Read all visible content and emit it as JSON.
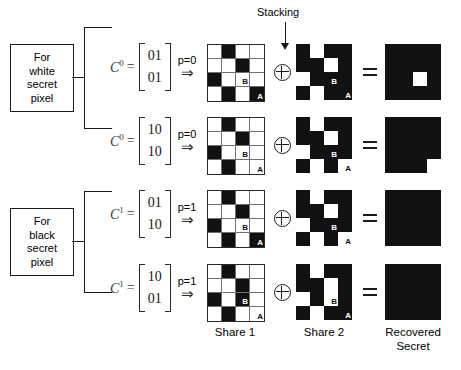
{
  "figure": {
    "stacking_label": "Stacking",
    "captions": {
      "share1": "Share 1",
      "share2": "Share 2",
      "recovered_line1": "Recovered",
      "recovered_line2": "Secret"
    },
    "groups": [
      {
        "id": "white",
        "line1": "For",
        "line2": "white",
        "line3": "secret",
        "line4": "pixel"
      },
      {
        "id": "black",
        "line1": "For",
        "line2": "black",
        "line3": "secret",
        "line4": "pixel"
      }
    ],
    "operators": {
      "xor": "⊕",
      "equals": "=",
      "implies": "⇒",
      "assign": "="
    },
    "marks": {
      "a": "A",
      "b": "B"
    },
    "rows": [
      {
        "matrix_name": "C",
        "matrix_sup": "0",
        "matrix_row1": "01",
        "matrix_row2": "01",
        "p_label": "p=0",
        "share1": [
          [
            "w",
            "b",
            "w",
            "w"
          ],
          [
            "w",
            "w",
            "b",
            "w"
          ],
          [
            "b",
            "w",
            "w",
            "w"
          ],
          [
            "w",
            "b",
            "w",
            "b"
          ]
        ],
        "share1_outlined": true,
        "share1_mark_b": {
          "row": 2,
          "col": 2,
          "on": "w"
        },
        "share1_mark_a": {
          "row": 3,
          "col": 3,
          "on": "b"
        },
        "share2": [
          [
            "b",
            "w",
            "b",
            "b"
          ],
          [
            "b",
            "b",
            "w",
            "b"
          ],
          [
            "w",
            "b",
            "b",
            "b"
          ],
          [
            "b",
            "w",
            "b",
            "b"
          ]
        ],
        "share2_outlined": false,
        "share2_mark_b": {
          "row": 2,
          "col": 2,
          "on": "b"
        },
        "share2_mark_a": {
          "row": 3,
          "col": 3,
          "on": "b"
        },
        "secret": [
          [
            "b",
            "b",
            "b",
            "b"
          ],
          [
            "b",
            "b",
            "b",
            "b"
          ],
          [
            "b",
            "b",
            "w",
            "b"
          ],
          [
            "b",
            "b",
            "b",
            "b"
          ]
        ]
      },
      {
        "matrix_name": "C",
        "matrix_sup": "0",
        "matrix_row1": "10",
        "matrix_row2": "10",
        "p_label": "p=0",
        "share1": [
          [
            "w",
            "b",
            "w",
            "w"
          ],
          [
            "w",
            "w",
            "b",
            "w"
          ],
          [
            "b",
            "w",
            "w",
            "w"
          ],
          [
            "w",
            "b",
            "w",
            "w"
          ]
        ],
        "share1_outlined": true,
        "share1_mark_b": {
          "row": 2,
          "col": 2,
          "on": "w"
        },
        "share1_mark_a": {
          "row": 3,
          "col": 3,
          "on": "w"
        },
        "share2": [
          [
            "b",
            "w",
            "b",
            "b"
          ],
          [
            "b",
            "b",
            "w",
            "b"
          ],
          [
            "w",
            "b",
            "b",
            "b"
          ],
          [
            "b",
            "w",
            "b",
            "w"
          ]
        ],
        "share2_outlined": false,
        "share2_mark_b": {
          "row": 2,
          "col": 2,
          "on": "b"
        },
        "share2_mark_a": {
          "row": 3,
          "col": 3,
          "on": "w"
        },
        "secret": [
          [
            "b",
            "b",
            "b",
            "b"
          ],
          [
            "b",
            "b",
            "b",
            "b"
          ],
          [
            "b",
            "b",
            "b",
            "b"
          ],
          [
            "b",
            "b",
            "b",
            "w"
          ]
        ]
      },
      {
        "matrix_name": "C",
        "matrix_sup": "1",
        "matrix_row1": "01",
        "matrix_row2": "10",
        "p_label": "p=1",
        "share1": [
          [
            "w",
            "b",
            "w",
            "w"
          ],
          [
            "w",
            "w",
            "b",
            "w"
          ],
          [
            "b",
            "w",
            "w",
            "w"
          ],
          [
            "w",
            "b",
            "w",
            "b"
          ]
        ],
        "share1_outlined": true,
        "share1_mark_b": {
          "row": 2,
          "col": 2,
          "on": "w"
        },
        "share1_mark_a": {
          "row": 3,
          "col": 3,
          "on": "b"
        },
        "share2": [
          [
            "b",
            "w",
            "b",
            "b"
          ],
          [
            "b",
            "b",
            "w",
            "b"
          ],
          [
            "w",
            "b",
            "b",
            "b"
          ],
          [
            "b",
            "w",
            "b",
            "w"
          ]
        ],
        "share2_outlined": false,
        "share2_mark_b": {
          "row": 2,
          "col": 2,
          "on": "b"
        },
        "share2_mark_a": {
          "row": 3,
          "col": 3,
          "on": "w"
        },
        "secret": [
          [
            "b",
            "b",
            "b",
            "b"
          ],
          [
            "b",
            "b",
            "b",
            "b"
          ],
          [
            "b",
            "b",
            "b",
            "b"
          ],
          [
            "b",
            "b",
            "b",
            "b"
          ]
        ]
      },
      {
        "matrix_name": "C",
        "matrix_sup": "1",
        "matrix_row1": "10",
        "matrix_row2": "01",
        "p_label": "p=1",
        "share1": [
          [
            "w",
            "b",
            "w",
            "w"
          ],
          [
            "w",
            "w",
            "b",
            "w"
          ],
          [
            "b",
            "w",
            "b",
            "w"
          ],
          [
            "w",
            "b",
            "w",
            "w"
          ]
        ],
        "share1_outlined": true,
        "share1_mark_b": {
          "row": 2,
          "col": 2,
          "on": "b"
        },
        "share1_mark_a": {
          "row": 3,
          "col": 3,
          "on": "w"
        },
        "share2": [
          [
            "b",
            "w",
            "b",
            "b"
          ],
          [
            "b",
            "b",
            "w",
            "b"
          ],
          [
            "w",
            "b",
            "w",
            "b"
          ],
          [
            "b",
            "w",
            "b",
            "b"
          ]
        ],
        "share2_outlined": false,
        "share2_mark_b": {
          "row": 2,
          "col": 2,
          "on": "w"
        },
        "share2_mark_a": {
          "row": 3,
          "col": 3,
          "on": "b"
        },
        "secret": [
          [
            "b",
            "b",
            "b",
            "b"
          ],
          [
            "b",
            "b",
            "b",
            "b"
          ],
          [
            "b",
            "b",
            "b",
            "b"
          ],
          [
            "b",
            "b",
            "b",
            "b"
          ]
        ]
      }
    ]
  }
}
